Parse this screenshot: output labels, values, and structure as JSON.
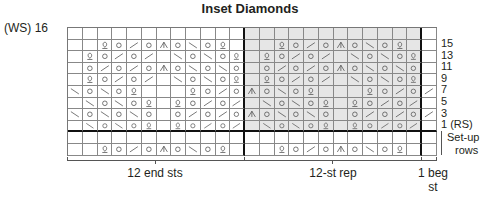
{
  "title": "Inset Diamonds",
  "ws_label": "(WS) 16",
  "row_labels": [
    "15",
    "13",
    "11",
    "9",
    "7",
    "5",
    "3",
    "1 (RS)"
  ],
  "setup_label_1": "Set-up",
  "setup_label_2": "rows",
  "bottom_labels": {
    "end": "12 end sts",
    "rep": "12-st rep",
    "beg_1": "1 beg",
    "beg_2": "st"
  },
  "legend_symbols": {
    "Q": "twisted stitch",
    "O": "yarn over",
    "/": "k2tog",
    "\\": "ssk",
    "^": "centered double decrease",
    "_": "knit"
  },
  "grid": {
    "columns": 25,
    "sections": {
      "end": 12,
      "rep": 12,
      "beg": 1
    },
    "rows": [
      {
        "label": "16",
        "cells": "_________________________"
      },
      {
        "label": "15",
        "cells": "__QO/O^O\\OQ___QO/O^O\\OQ__"
      },
      {
        "label": "13",
        "cells": "_QO/O/_\\O\\OQ_QO/O/_\\O\\OQ_"
      },
      {
        "label": "11",
        "cells": "_O/O/O^O\\O\\O_O/O/O^O\\O\\O_"
      },
      {
        "label": "9",
        "cells": "_QO/O/_\\O\\OQ_QO/O/_\\O\\OQ_"
      },
      {
        "label": "7",
        "cells": "\\O\\OQ___QO/O^O\\OQ___QO/O/"
      },
      {
        "label": "5",
        "cells": "_\\O\\OQ_QO/O/_\\O\\OQ_QO/O/_"
      },
      {
        "label": "3",
        "cells": "\\O\\O\\O_O/O/O^O\\O\\O_O/O/O/"
      },
      {
        "label": "1",
        "cells": "_\\O\\OQ_QO/O/_\\O\\OQ_QO/O/_"
      },
      {
        "label": "setup-2",
        "cells": "_________________________"
      },
      {
        "label": "setup-1",
        "cells": "__QO/O^O\\OQ___QO/O^O\\OQ__"
      }
    ]
  }
}
